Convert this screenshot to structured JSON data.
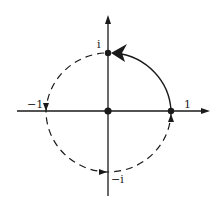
{
  "diagram": {
    "labels": {
      "one": "1",
      "i": "i",
      "neg_one": "−1",
      "neg_i": "−i"
    },
    "points": [
      {
        "name": "origin",
        "re": 0,
        "im": 0
      },
      {
        "name": "one",
        "re": 1,
        "im": 0
      },
      {
        "name": "i",
        "re": 0,
        "im": 1
      }
    ],
    "arcs": [
      {
        "name": "solid-arc",
        "from": "1",
        "to": "i",
        "style": "solid"
      },
      {
        "name": "dashed-arc",
        "from": "i",
        "to": "1",
        "via": [
          "-1",
          "-i"
        ],
        "style": "dashed"
      }
    ],
    "colors": {
      "ink": "#1a1a1a",
      "background": "#ffffff"
    }
  }
}
